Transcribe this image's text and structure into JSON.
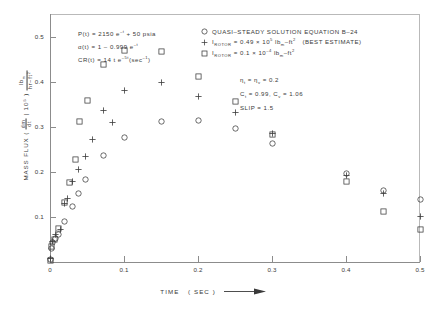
{
  "chart_data": {
    "type": "scatter",
    "title": "",
    "xlabel": "TIME (SEC)",
    "ylabel": "MASS FLUX (dm/dt | 10⁵) lbm/hr-ft²",
    "xlim": [
      0,
      0.5
    ],
    "ylim": [
      0,
      0.55
    ],
    "xticks": [
      "0",
      "0.1",
      "0.2",
      "0.3",
      "0.4",
      "0.5"
    ],
    "xtick_values": [
      0,
      0.1,
      0.2,
      0.3,
      0.4,
      0.5
    ],
    "yticks": [
      "0.1",
      "0.2",
      "0.3",
      "0.4",
      "0.5"
    ],
    "ytick_values": [
      0.1,
      0.2,
      0.3,
      0.4,
      0.5
    ],
    "grid": false,
    "legend_position": "top-right",
    "series": [
      {
        "name": "QUASI-STEADY SOLUTION EQUATION B-24",
        "marker": "circle",
        "points": [
          {
            "x": 0.0,
            "y": 0.005
          },
          {
            "x": 0.002,
            "y": 0.03
          },
          {
            "x": 0.004,
            "y": 0.043
          },
          {
            "x": 0.008,
            "y": 0.052
          },
          {
            "x": 0.012,
            "y": 0.062
          },
          {
            "x": 0.02,
            "y": 0.09
          },
          {
            "x": 0.03,
            "y": 0.123
          },
          {
            "x": 0.038,
            "y": 0.152
          },
          {
            "x": 0.048,
            "y": 0.182
          },
          {
            "x": 0.072,
            "y": 0.237
          },
          {
            "x": 0.1,
            "y": 0.277
          },
          {
            "x": 0.15,
            "y": 0.311
          },
          {
            "x": 0.2,
            "y": 0.313
          },
          {
            "x": 0.25,
            "y": 0.295
          },
          {
            "x": 0.3,
            "y": 0.263
          },
          {
            "x": 0.4,
            "y": 0.196
          },
          {
            "x": 0.45,
            "y": 0.158
          },
          {
            "x": 0.5,
            "y": 0.138
          }
        ]
      },
      {
        "name": "I_ROTOR = 0.49 x 10^5 lbm-ft^2 (BEST ESTIMATE)",
        "marker": "plus",
        "points": [
          {
            "x": 0.0,
            "y": 0.008
          },
          {
            "x": 0.004,
            "y": 0.046
          },
          {
            "x": 0.008,
            "y": 0.06
          },
          {
            "x": 0.014,
            "y": 0.073
          },
          {
            "x": 0.02,
            "y": 0.13
          },
          {
            "x": 0.024,
            "y": 0.14
          },
          {
            "x": 0.03,
            "y": 0.178
          },
          {
            "x": 0.038,
            "y": 0.205
          },
          {
            "x": 0.048,
            "y": 0.235
          },
          {
            "x": 0.058,
            "y": 0.272
          },
          {
            "x": 0.072,
            "y": 0.337
          },
          {
            "x": 0.085,
            "y": 0.31
          },
          {
            "x": 0.1,
            "y": 0.38
          },
          {
            "x": 0.15,
            "y": 0.398
          },
          {
            "x": 0.2,
            "y": 0.368
          },
          {
            "x": 0.25,
            "y": 0.332
          },
          {
            "x": 0.3,
            "y": 0.285
          },
          {
            "x": 0.4,
            "y": 0.192
          },
          {
            "x": 0.45,
            "y": 0.152
          },
          {
            "x": 0.5,
            "y": 0.1
          }
        ]
      },
      {
        "name": "I_ROTOR = 0.1 x 10^-4 lbm-ft^2",
        "marker": "square",
        "points": [
          {
            "x": 0.0,
            "y": 0.004
          },
          {
            "x": 0.002,
            "y": 0.035
          },
          {
            "x": 0.006,
            "y": 0.05
          },
          {
            "x": 0.012,
            "y": 0.075
          },
          {
            "x": 0.02,
            "y": 0.131
          },
          {
            "x": 0.026,
            "y": 0.177
          },
          {
            "x": 0.034,
            "y": 0.228
          },
          {
            "x": 0.04,
            "y": 0.312
          },
          {
            "x": 0.05,
            "y": 0.358
          },
          {
            "x": 0.072,
            "y": 0.437
          },
          {
            "x": 0.1,
            "y": 0.47
          },
          {
            "x": 0.15,
            "y": 0.466
          },
          {
            "x": 0.2,
            "y": 0.411
          },
          {
            "x": 0.25,
            "y": 0.355
          },
          {
            "x": 0.3,
            "y": 0.283
          },
          {
            "x": 0.4,
            "y": 0.178
          },
          {
            "x": 0.45,
            "y": 0.113
          },
          {
            "x": 0.5,
            "y": 0.073
          }
        ]
      }
    ],
    "annotations": {
      "equations": [
        "P(t) = 2150 e⁻ᵗ + 50 psia",
        "α(t) = 1 - 0.999 e⁻ᵗ",
        "CR(t) = 14 t e⁻⁵ᵗ (sec⁻¹)"
      ],
      "parameters": [
        "ηₜ = ηᵥ = 0.2",
        "Cₜ = 0.99, Cᵥ = 1.06",
        "SLIP = 1.5"
      ]
    },
    "legend_entries": [
      {
        "marker": "circle",
        "label": "QUASI-STEADY SOLUTION EQUATION B-24"
      },
      {
        "marker": "plus",
        "label": "I_ROTOR = 0.49 x 10^5 lbm-ft^2 (BEST ESTIMATE)"
      },
      {
        "marker": "square",
        "label": "I_ROTOR = 0.1 x 10^-4 lbm-ft^2"
      }
    ]
  },
  "axes": {
    "x_title": "TIME",
    "x_units": "( SEC )",
    "y_title": "MASS FLUX",
    "y_open": "(",
    "y_dm": "dm",
    "y_dt": "dt",
    "y_scale": "| 10⁵",
    "y_num": "lb",
    "y_num_sub": "m",
    "y_den": "hr–ft",
    "y_den_sup": "2"
  },
  "legend": {
    "row1": "QUASI–STEADY SOLUTION EQUATION  B–24",
    "row2_pre": "I",
    "row2_sub": "ROTOR",
    "row2_mid": "= 0.49 × 10",
    "row2_sup": "5",
    "row2_unit": " lb",
    "row2_unit_sub": "m",
    "row2_unit_tail": "–ft",
    "row2_unit_sup": "2",
    "row2_note": "(BEST ESTIMATE)",
    "row3_pre": "I",
    "row3_sub": "ROTOR",
    "row3_mid": "= 0.1 × 10",
    "row3_sup": "–4",
    "row3_unit": " lb",
    "row3_unit_sub": "m",
    "row3_unit_tail": "–ft",
    "row3_unit_sup": "2"
  },
  "equations": {
    "line1_a": "P(t) = 2150 e",
    "line1_sup": "–t",
    "line1_b": "+ 50 psia",
    "line2_a": "α(t) = 1 – 0.999 e",
    "line2_sup": "–t",
    "line3_a": "CR(t) = 14 t e",
    "line3_sup": "–5t",
    "line3_b": "(sec",
    "line3_sup2": "–1",
    "line3_c": ")"
  },
  "params": {
    "line1_a": "η",
    "line1_sub1": "t",
    "line1_b": "= η",
    "line1_sub2": "v",
    "line1_c": "= 0.2",
    "line2_a": "C",
    "line2_sub1": "t",
    "line2_b": "= 0.99, C",
    "line2_sub2": "v",
    "line2_c": "= 1.06",
    "line3": "SLIP = 1.5"
  },
  "colors": {
    "ink": "#3a3a3a",
    "axis": "#8c8c8c",
    "frame": "#b9b9b9",
    "background": "#ffffff"
  }
}
